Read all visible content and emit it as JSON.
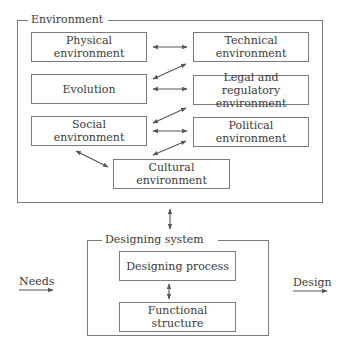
{
  "environment": {
    "label": "Environment",
    "boxes": {
      "physical": [
        "Physical",
        "environment"
      ],
      "technical": [
        "Technical",
        "environment"
      ],
      "evolution": [
        "Evolution"
      ],
      "legal": [
        "Legal and regulatory",
        "environment"
      ],
      "social": [
        "Social",
        "environment"
      ],
      "political": [
        "Political",
        "environment"
      ],
      "cultural": [
        "Cultural",
        "environment"
      ]
    }
  },
  "designing_system": {
    "label": "Designing system",
    "process": "Designing process",
    "structure": "Functional structure"
  },
  "input": {
    "label": "Needs"
  },
  "output": {
    "label": "Design"
  },
  "colors": {
    "line": "#7a7a7a",
    "text": "#3a3a3a",
    "arrow": "#555555"
  }
}
